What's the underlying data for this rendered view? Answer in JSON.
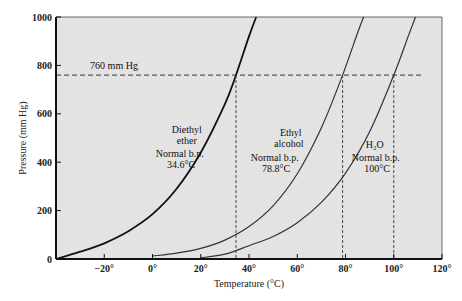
{
  "chart_data": {
    "type": "line",
    "title": "",
    "xlabel": "Temperature (°C)",
    "ylabel": "Pressure (mm Hg)",
    "xlim": [
      -40,
      120
    ],
    "ylim": [
      0,
      1000
    ],
    "x_ticks": [
      -20,
      0,
      20,
      40,
      60,
      80,
      100,
      120
    ],
    "x_tick_labels": [
      "−20°",
      "0°",
      "20°",
      "40°",
      "60°",
      "80°",
      "100°",
      "120°"
    ],
    "y_ticks": [
      0,
      200,
      400,
      600,
      800,
      1000
    ],
    "y_tick_labels": [
      "0",
      "200",
      "400",
      "600",
      "800",
      "1000"
    ],
    "grid": false,
    "reference_line": {
      "y": 760,
      "label": "760 mm Hg"
    },
    "series": [
      {
        "name": "Diethyl ether",
        "label_lines": [
          "Diethyl",
          "ether",
          "Normal b.p.",
          "34.6°C"
        ],
        "boiling_point": 34.6,
        "points": [
          [
            -40,
            0
          ],
          [
            -30,
            30
          ],
          [
            -20,
            65
          ],
          [
            -10,
            115
          ],
          [
            0,
            185
          ],
          [
            10,
            290
          ],
          [
            20,
            440
          ],
          [
            30,
            640
          ],
          [
            34.6,
            760
          ],
          [
            40,
            920
          ],
          [
            43,
            1000
          ]
        ]
      },
      {
        "name": "Ethyl alcohol",
        "label_lines": [
          "Ethyl",
          "alcohol",
          "Normal b.p.",
          "78.8°C"
        ],
        "boiling_point": 78.8,
        "points": [
          [
            0,
            12
          ],
          [
            10,
            24
          ],
          [
            20,
            44
          ],
          [
            30,
            78
          ],
          [
            40,
            134
          ],
          [
            50,
            220
          ],
          [
            60,
            352
          ],
          [
            70,
            542
          ],
          [
            78.8,
            760
          ],
          [
            85,
            935
          ],
          [
            87.5,
            1000
          ]
        ]
      },
      {
        "name": "H2O",
        "label_lines": [
          "H₂O",
          "Normal b.p.",
          "100°C"
        ],
        "boiling_point": 100,
        "points": [
          [
            20,
            5
          ],
          [
            30,
            20
          ],
          [
            40,
            55
          ],
          [
            50,
            93
          ],
          [
            60,
            150
          ],
          [
            70,
            234
          ],
          [
            80,
            355
          ],
          [
            90,
            526
          ],
          [
            100,
            760
          ],
          [
            106,
            920
          ],
          [
            109,
            1000
          ]
        ]
      }
    ]
  }
}
